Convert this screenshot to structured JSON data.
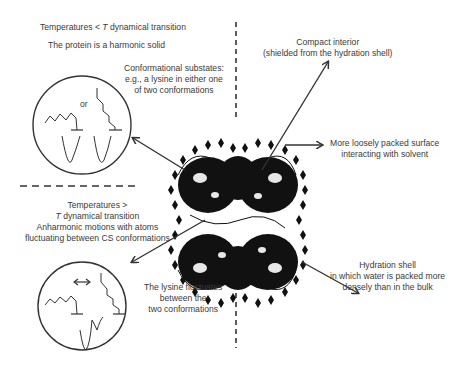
{
  "top_left": {
    "title_prefix": "Temperatures < ",
    "title_italic": "T",
    "title_suffix": " dynamical transition",
    "subtitle": "The protein is a harmonic solid",
    "substates_line1": "Conformational substates:",
    "substates_line2": "e.g., a lysine in either one",
    "substates_line3": "of two conformations",
    "or_label": "or"
  },
  "bottom_left": {
    "line1": "Temperatures >",
    "line2_italic": "T",
    "line2_suffix": " dynamical transition",
    "line3": "Anharmonic motions with atoms",
    "line4": "fluctuating between CS conformations",
    "fluct_line1": "The lysine fluctuates",
    "fluct_line2": "between the",
    "fluct_line3": "two conformations"
  },
  "right": {
    "compact_line1": "Compact interior",
    "compact_line2": "(shielded from the hydration shell)",
    "surface_line1": "More loosely packed surface",
    "surface_line2": "interacting with solvent",
    "hydration_line1": "Hydration shell",
    "hydration_line2": "in which water is packed more",
    "hydration_line3": "densely than in the bulk"
  },
  "colors": {
    "text": "#3a3a3a",
    "lines": "#333333",
    "protein": "#111111"
  }
}
